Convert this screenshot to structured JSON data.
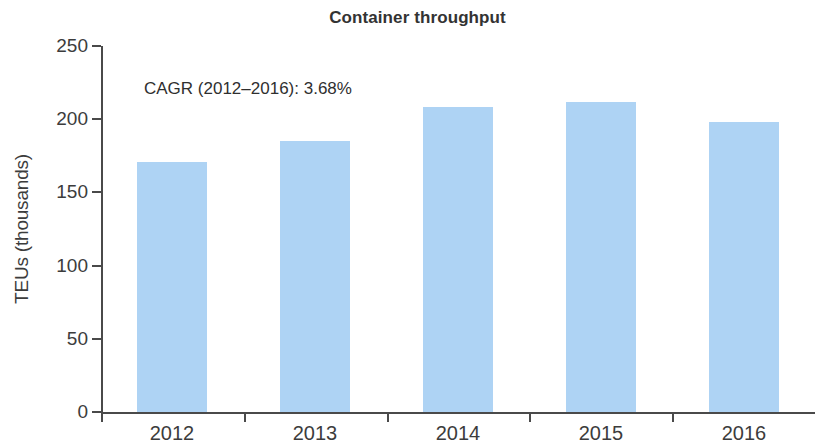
{
  "chart_data": {
    "type": "bar",
    "title": "Container throughput",
    "xlabel": "",
    "ylabel": "TEUs (thousands)",
    "categories": [
      "2012",
      "2013",
      "2014",
      "2015",
      "2016"
    ],
    "values": [
      171,
      185,
      208,
      212,
      198
    ],
    "series": [
      {
        "name": "Container throughput",
        "values": [
          171,
          185,
          208,
          212,
          198
        ]
      }
    ],
    "ylim": [
      0,
      250
    ],
    "yticks": [
      0,
      50,
      100,
      150,
      200,
      250
    ],
    "ytick_labels": [
      "0",
      "50",
      "100",
      "150",
      "200",
      "250"
    ],
    "grid": false,
    "legend": false,
    "legend_position": "none",
    "annotations": [
      {
        "text": "CAGR (2012–2016): 3.68%",
        "x": "2012",
        "y": 228
      }
    ],
    "colors": {
      "bar_fill": "#aed3f4",
      "axis": "#4a4a4a",
      "text": "#3c3c3c",
      "title": "#333333",
      "background": "#ffffff"
    }
  }
}
